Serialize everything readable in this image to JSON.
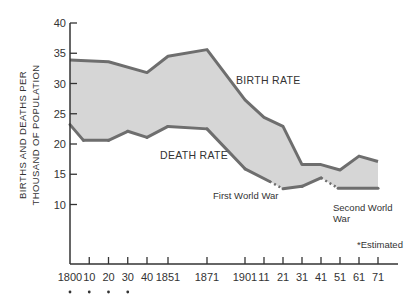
{
  "chart_data": {
    "type": "area",
    "title": "",
    "xlabel": "",
    "ylabel": "BIRTHS AND DEATHS PER THOUSAND OF POPULATION",
    "ylabel_lines": [
      "BIRTHS AND DEATHS PER",
      "THOUSAND OF POPULATION"
    ],
    "ylim": [
      0,
      40
    ],
    "yticks": [
      10,
      15,
      20,
      25,
      30,
      35,
      40
    ],
    "x_ticks": [
      {
        "year": 1800,
        "label": "1800",
        "estimated": true
      },
      {
        "year": 1810,
        "label": "10",
        "estimated": true
      },
      {
        "year": 1820,
        "label": "20",
        "estimated": true
      },
      {
        "year": 1830,
        "label": "30",
        "estimated": true
      },
      {
        "year": 1840,
        "label": "40",
        "estimated": false
      },
      {
        "year": 1851,
        "label": "1851",
        "estimated": false
      },
      {
        "year": 1871,
        "label": "1871",
        "estimated": false
      },
      {
        "year": 1901,
        "label": "1901",
        "estimated": false
      },
      {
        "year": 1911,
        "label": "11",
        "estimated": false
      },
      {
        "year": 1921,
        "label": "21",
        "estimated": false
      },
      {
        "year": 1931,
        "label": "31",
        "estimated": false
      },
      {
        "year": 1941,
        "label": "41",
        "estimated": false
      },
      {
        "year": 1951,
        "label": "51",
        "estimated": false
      },
      {
        "year": 1961,
        "label": "61",
        "estimated": false
      },
      {
        "year": 1971,
        "label": "71",
        "estimated": false
      }
    ],
    "grid": false,
    "series": [
      {
        "name": "BIRTH RATE",
        "x": [
          1800,
          1820,
          1840,
          1851,
          1871,
          1901,
          1911,
          1921,
          1931,
          1941,
          1951,
          1961,
          1971
        ],
        "values": [
          33.9,
          33.6,
          31.8,
          34.5,
          35.6,
          27.3,
          24.4,
          22.9,
          16.6,
          16.6,
          15.7,
          18.0,
          17.1
        ]
      },
      {
        "name": "DEATH RATE",
        "x": [
          1800,
          1807,
          1820,
          1830,
          1840,
          1851,
          1871,
          1901,
          1914,
          1921,
          1931,
          1941,
          1950,
          1971
        ],
        "values": [
          23.2,
          20.6,
          20.6,
          22.1,
          21.1,
          22.9,
          22.5,
          15.9,
          13.8,
          12.6,
          13.0,
          14.4,
          12.7,
          12.7
        ],
        "dashed_segments": [
          [
            1914,
            1921
          ],
          [
            1941,
            1950
          ]
        ]
      }
    ],
    "annotations": [
      {
        "text": "BIRTH RATE",
        "near_year": 1911,
        "value": 29.5
      },
      {
        "text": "DEATH RATE",
        "near_year": 1851,
        "value": 18.5
      },
      {
        "text": "First World War",
        "near_year": 1914,
        "value": 10.3
      },
      {
        "text": "Second World War",
        "near_year": 1951,
        "value": 9.3
      },
      {
        "text": "*Estimated",
        "position": "lower-right"
      }
    ],
    "colors": {
      "fill": "#d6d6d6",
      "line": "#6e6e6e",
      "axis": "#333333"
    }
  },
  "labels": {
    "ylabel_line1": "BIRTHS AND DEATHS PER",
    "ylabel_line2": "THOUSAND OF POPULATION",
    "birth_rate": "BIRTH RATE",
    "death_rate": "DEATH RATE",
    "ww1": "First World War",
    "ww2_line1": "Second World",
    "ww2_line2": "War",
    "estimated_note": "*Estimated"
  }
}
